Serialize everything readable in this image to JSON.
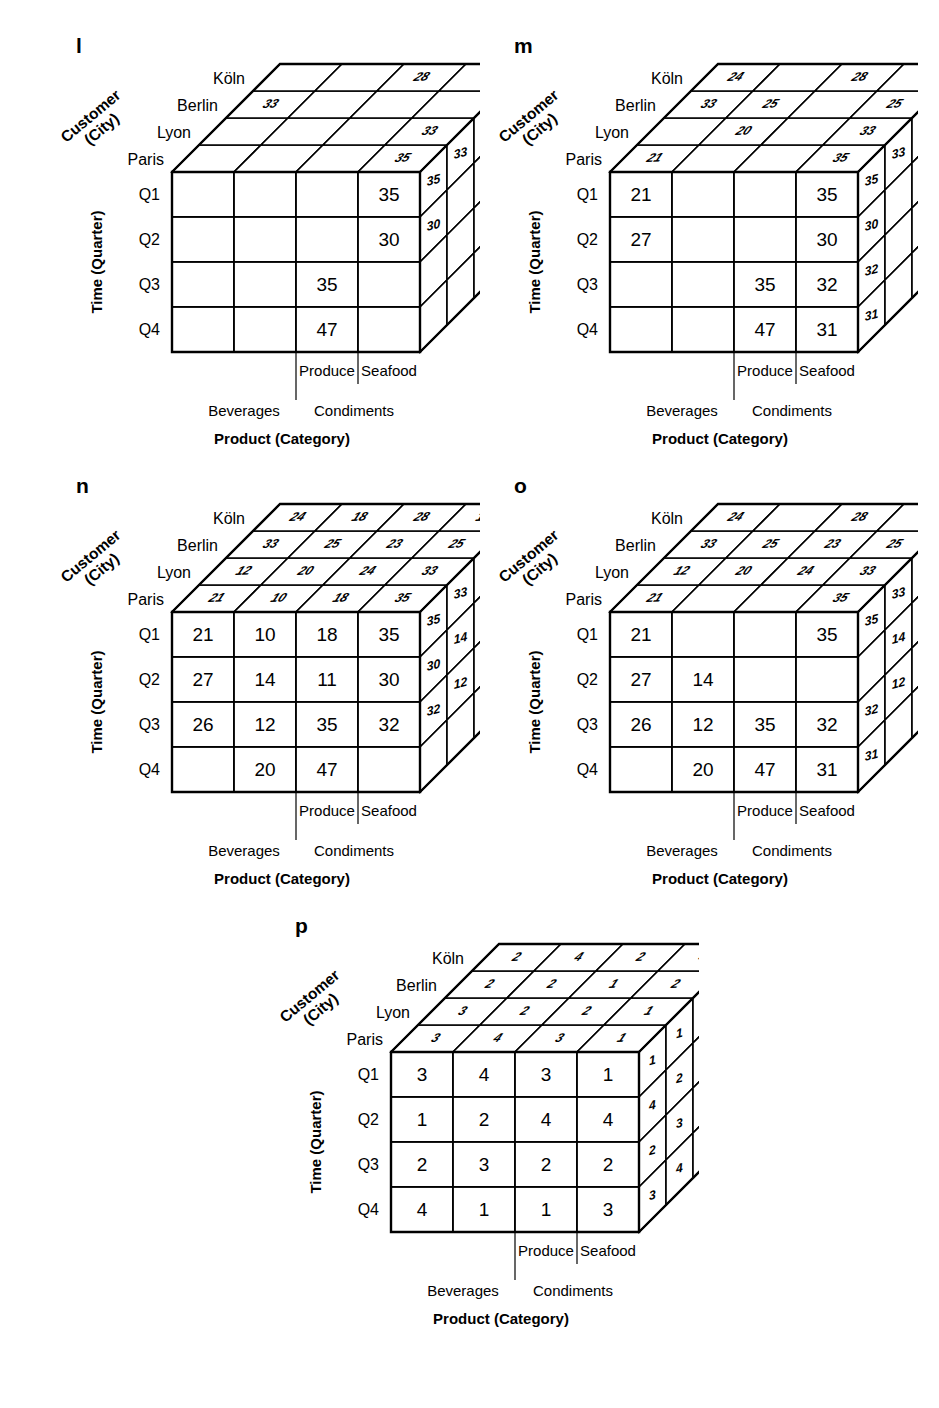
{
  "figure": {
    "domain": "diagram",
    "type": "olap-data-cubes",
    "panel_count": 5
  },
  "common": {
    "axis_labels": {
      "x": "Product (Category)",
      "y": "Time (Quarter)",
      "z_line1": "Customer",
      "z_line2": "(City)"
    },
    "quarters": [
      "Q1",
      "Q2",
      "Q3",
      "Q4"
    ],
    "categories": [
      "Beverages",
      "Condiments",
      "Produce",
      "Seafood"
    ],
    "cities": [
      "Paris",
      "Lyon",
      "Berlin",
      "Köln"
    ],
    "city_order_top_to_bottom": [
      "Köln",
      "Berlin",
      "Lyon",
      "Paris"
    ]
  },
  "panels": [
    {
      "id": "l",
      "label": "l",
      "front": [
        [
          "",
          "",
          "",
          "35"
        ],
        [
          "",
          "",
          "",
          "30"
        ],
        [
          "",
          "",
          "35",
          ""
        ],
        [
          "",
          "",
          "47",
          ""
        ]
      ],
      "top": [
        [
          "",
          "",
          "28",
          ""
        ],
        [
          "33",
          "",
          "",
          ""
        ],
        [
          "",
          "",
          "",
          "33"
        ],
        [
          "",
          "",
          "",
          "35"
        ]
      ],
      "side": [
        [
          "35",
          "30",
          "",
          ""
        ],
        [
          "33",
          "",
          "",
          ""
        ],
        [
          "23",
          "",
          "33",
          ""
        ]
      ]
    },
    {
      "id": "m",
      "label": "m",
      "front": [
        [
          "21",
          "",
          "",
          "35"
        ],
        [
          "27",
          "",
          "",
          "30"
        ],
        [
          "",
          "",
          "35",
          "32"
        ],
        [
          "",
          "",
          "47",
          "31"
        ]
      ],
      "top": [
        [
          "24",
          "",
          "28",
          ""
        ],
        [
          "33",
          "25",
          "",
          "25"
        ],
        [
          "",
          "20",
          "",
          "33"
        ],
        [
          "21",
          "",
          "",
          "35"
        ]
      ],
      "side": [
        [
          "35",
          "30",
          "32",
          "31"
        ],
        [
          "33",
          "",
          "",
          ""
        ],
        [
          "25",
          "23",
          "20",
          "33"
        ]
      ]
    },
    {
      "id": "n",
      "label": "n",
      "front": [
        [
          "21",
          "10",
          "18",
          "35"
        ],
        [
          "27",
          "14",
          "11",
          "30"
        ],
        [
          "26",
          "12",
          "35",
          "32"
        ],
        [
          "",
          "20",
          "47",
          ""
        ]
      ],
      "top": [
        [
          "24",
          "18",
          "28",
          "14"
        ],
        [
          "33",
          "25",
          "23",
          "25"
        ],
        [
          "12",
          "20",
          "24",
          "33"
        ],
        [
          "21",
          "10",
          "18",
          "35"
        ]
      ],
      "side": [
        [
          "35",
          "30",
          "32",
          ""
        ],
        [
          "33",
          "14",
          "12",
          ""
        ],
        [
          "25",
          "23",
          "20",
          "33"
        ],
        [
          "14",
          "18",
          "17",
          ""
        ]
      ]
    },
    {
      "id": "o",
      "label": "o",
      "front": [
        [
          "21",
          "",
          "",
          "35"
        ],
        [
          "27",
          "14",
          "",
          ""
        ],
        [
          "26",
          "12",
          "35",
          "32"
        ],
        [
          "",
          "20",
          "47",
          "31"
        ]
      ],
      "top": [
        [
          "24",
          "",
          "28",
          ""
        ],
        [
          "33",
          "25",
          "23",
          "25"
        ],
        [
          "12",
          "20",
          "24",
          "33"
        ],
        [
          "21",
          "",
          "",
          "35"
        ]
      ],
      "side": [
        [
          "35",
          "",
          "32",
          "31"
        ],
        [
          "33",
          "14",
          "12",
          ""
        ],
        [
          "25",
          "23",
          "",
          "33"
        ],
        [
          "18",
          "17",
          "18",
          ""
        ]
      ]
    },
    {
      "id": "p",
      "label": "p",
      "front": [
        [
          "3",
          "4",
          "3",
          "1"
        ],
        [
          "1",
          "2",
          "4",
          "4"
        ],
        [
          "2",
          "3",
          "2",
          "2"
        ],
        [
          "4",
          "1",
          "1",
          "3"
        ]
      ],
      "top": [
        [
          "2",
          "4",
          "2",
          "4"
        ],
        [
          "2",
          "2",
          "1",
          "2"
        ],
        [
          "3",
          "2",
          "2",
          "1"
        ],
        [
          "3",
          "4",
          "3",
          "1"
        ]
      ],
      "side": [
        [
          "1",
          "4",
          "2",
          "3"
        ],
        [
          "1",
          "2",
          "3",
          "4"
        ],
        [
          "2",
          "3",
          "4",
          "1"
        ],
        [
          "4",
          "1",
          "3",
          "1"
        ]
      ]
    }
  ],
  "chart_data": {
    "type": "table",
    "dimensions": {
      "Product (Category)": [
        "Beverages",
        "Condiments",
        "Produce",
        "Seafood"
      ],
      "Time (Quarter)": [
        "Q1",
        "Q2",
        "Q3",
        "Q4"
      ],
      "Customer (City)": [
        "Paris",
        "Lyon",
        "Berlin",
        "Köln"
      ]
    }
  }
}
